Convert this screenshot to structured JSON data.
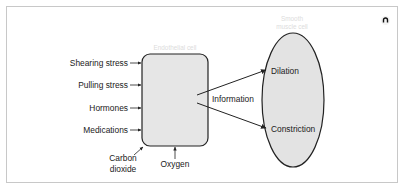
{
  "diagram": {
    "endothelial_cell": {
      "label": "Endothelial cell",
      "fill": "#e6e6e6",
      "stroke": "#222222"
    },
    "smooth_muscle_cell": {
      "label_line1": "Smooth",
      "label_line2": "muscle cell",
      "fill": "#e3e3e3",
      "stroke": "#222222"
    },
    "inputs": [
      {
        "label": "Shearing stress"
      },
      {
        "label": "Pulling stress"
      },
      {
        "label": "Hormones"
      },
      {
        "label": "Medications"
      }
    ],
    "bottom_inputs": {
      "carbon_dioxide_line1": "Carbon",
      "carbon_dioxide_line2": "dioxide",
      "oxygen": "Oxygen"
    },
    "connector_label": "Information",
    "outputs": [
      {
        "label": "Dilation"
      },
      {
        "label": "Constriction"
      }
    ]
  },
  "corner_icon": "settings-toggle-icon"
}
